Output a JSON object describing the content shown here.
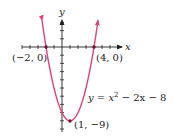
{
  "chart_data": {
    "type": "line",
    "title": "",
    "xlabel": "x",
    "ylabel": "y",
    "function": "y = x^2 - 2x - 8",
    "series": [
      {
        "name": "y = x² − 2x − 8",
        "color": "#e0407a",
        "x": [
          -2.5,
          -2,
          -1,
          0,
          1,
          2,
          3,
          4,
          4.5
        ],
        "y": [
          3.25,
          0,
          -5,
          -8,
          -9,
          -8,
          -5,
          0,
          3.25
        ]
      }
    ],
    "annotations": [
      {
        "label": "(−2, 0)",
        "x": -2,
        "y": 0
      },
      {
        "label": "(4, 0)",
        "x": 4,
        "y": 0
      },
      {
        "label": "(1, −9)",
        "x": 1,
        "y": -9
      }
    ],
    "xlim": [
      -5,
      7
    ],
    "ylim": [
      -10,
      4
    ],
    "grid": false,
    "legend": "none"
  },
  "labels": {
    "x_axis": "x",
    "y_axis": "y",
    "equation_prefix": "y = x",
    "equation_exp": "2",
    "equation_suffix": " − 2x − 8",
    "point_left": "(−2, 0)",
    "point_right": "(4, 0)",
    "point_vertex": "(1, −9)"
  },
  "colors": {
    "curve": "#e0407a",
    "axis": "#222222",
    "point": "#7a1030"
  }
}
